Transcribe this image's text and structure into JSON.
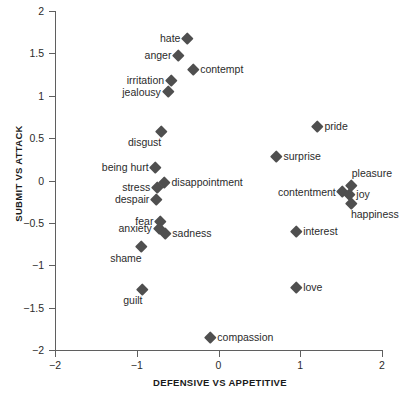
{
  "chart_data": {
    "type": "scatter",
    "title": "",
    "xlabel": "DEFENSIVE VS APPETITIVE",
    "ylabel": "SUBMIT VS ATTACK",
    "xlim": [
      -2,
      2
    ],
    "ylim": [
      -2,
      2
    ],
    "xticks": [
      "-2",
      "-1",
      "0",
      "1",
      "2"
    ],
    "xtick_values": [
      -2,
      -1,
      0,
      1,
      2
    ],
    "yticks": [
      "2",
      "1.5",
      "1",
      "0.5",
      "0",
      "-0.5",
      "-1",
      "-1.5",
      "-2"
    ],
    "ytick_values": [
      2,
      1.5,
      1,
      0.5,
      0,
      -0.5,
      -1,
      -1.5,
      -2
    ],
    "grid": false,
    "legend": false,
    "marker_color": "#4f4f4f",
    "marker_shape": "diamond",
    "axis_color": "#5f5f5f",
    "points": [
      {
        "label": "hate",
        "x": -0.38,
        "y": 1.68,
        "label_pos": "lbl-left"
      },
      {
        "label": "anger",
        "x": -0.49,
        "y": 1.48,
        "label_pos": "lbl-left"
      },
      {
        "label": "contempt",
        "x": -0.31,
        "y": 1.31,
        "label_pos": "lbl-right"
      },
      {
        "label": "irritation",
        "x": -0.58,
        "y": 1.18,
        "label_pos": "lbl-left"
      },
      {
        "label": "jealousy",
        "x": -0.62,
        "y": 1.05,
        "label_pos": "lbl-left"
      },
      {
        "label": "disgust",
        "x": -0.7,
        "y": 0.58,
        "label_pos": "lbl-below-left"
      },
      {
        "label": "pride",
        "x": 1.21,
        "y": 0.64,
        "label_pos": "lbl-right"
      },
      {
        "label": "surprise",
        "x": 0.71,
        "y": 0.29,
        "label_pos": "lbl-right"
      },
      {
        "label": "being hurt",
        "x": -0.77,
        "y": 0.16,
        "label_pos": "lbl-left"
      },
      {
        "label": "disappointment",
        "x": -0.66,
        "y": -0.02,
        "label_pos": "lbl-right"
      },
      {
        "label": "stress",
        "x": -0.75,
        "y": -0.08,
        "label_pos": "lbl-left"
      },
      {
        "label": "pleasure",
        "x": 1.63,
        "y": -0.06,
        "label_pos": "lbl-above-right"
      },
      {
        "label": "contentment",
        "x": 1.52,
        "y": -0.13,
        "label_pos": "lbl-left"
      },
      {
        "label": "joy",
        "x": 1.6,
        "y": -0.16,
        "label_pos": "lbl-right"
      },
      {
        "label": "despair",
        "x": -0.76,
        "y": -0.22,
        "label_pos": "lbl-left"
      },
      {
        "label": "happiness",
        "x": 1.62,
        "y": -0.27,
        "label_pos": "lbl-below-right"
      },
      {
        "label": "fear",
        "x": -0.71,
        "y": -0.48,
        "label_pos": "lbl-left"
      },
      {
        "label": "anxiety",
        "x": -0.73,
        "y": -0.56,
        "label_pos": "lbl-left"
      },
      {
        "label": "sadness",
        "x": -0.65,
        "y": -0.62,
        "label_pos": "lbl-right"
      },
      {
        "label": "interest",
        "x": 0.95,
        "y": -0.6,
        "label_pos": "lbl-right"
      },
      {
        "label": "shame",
        "x": -0.94,
        "y": -0.78,
        "label_pos": "lbl-below-left"
      },
      {
        "label": "love",
        "x": 0.95,
        "y": -1.26,
        "label_pos": "lbl-right"
      },
      {
        "label": "guilt",
        "x": -0.93,
        "y": -1.28,
        "label_pos": "lbl-below-left"
      },
      {
        "label": "compassion",
        "x": -0.1,
        "y": -1.85,
        "label_pos": "lbl-right"
      }
    ]
  }
}
